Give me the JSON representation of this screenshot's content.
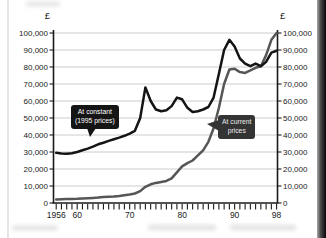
{
  "chart_data": {
    "type": "line",
    "title": "",
    "currency": "£",
    "xlabel": "",
    "ylabel": "£",
    "xlim": [
      1956,
      1998
    ],
    "ylim": [
      0,
      100000
    ],
    "y_tick_interval": 10000,
    "y_axis_sides": [
      "left",
      "right"
    ],
    "grid": "horizontal",
    "x_tick_every_year": true,
    "x_labels": [
      {
        "year": 1956,
        "label": "1956"
      },
      {
        "year": 1960,
        "label": "60"
      },
      {
        "year": 1970,
        "label": "70"
      },
      {
        "year": 1980,
        "label": "80"
      },
      {
        "year": 1990,
        "label": "90"
      },
      {
        "year": 1998,
        "label": "98"
      }
    ],
    "years": [
      1956,
      1957,
      1958,
      1959,
      1960,
      1961,
      1962,
      1963,
      1964,
      1965,
      1966,
      1967,
      1968,
      1969,
      1970,
      1971,
      1972,
      1973,
      1974,
      1975,
      1976,
      1977,
      1978,
      1979,
      1980,
      1981,
      1982,
      1983,
      1984,
      1985,
      1986,
      1987,
      1988,
      1989,
      1990,
      1991,
      1992,
      1993,
      1994,
      1995,
      1996,
      1997,
      1998
    ],
    "series": [
      {
        "name": "At current prices",
        "color": "#565656",
        "width": 2.5,
        "values": [
          2100,
          2200,
          2300,
          2400,
          2500,
          2700,
          2800,
          3000,
          3200,
          3500,
          3700,
          3900,
          4200,
          4600,
          5000,
          5600,
          7000,
          9500,
          11000,
          11800,
          12400,
          13000,
          14500,
          18000,
          21500,
          23500,
          25000,
          28000,
          31000,
          36000,
          44000,
          56000,
          70000,
          78500,
          79000,
          77000,
          76500,
          78000,
          79500,
          80500,
          87000,
          96000,
          100000
        ]
      },
      {
        "name": "At constant (1995 prices)",
        "color": "#141414",
        "width": 2.5,
        "values": [
          29500,
          29200,
          29000,
          29300,
          30000,
          31000,
          32000,
          33200,
          34500,
          35500,
          36500,
          37500,
          38500,
          39500,
          40800,
          42500,
          50000,
          68000,
          60000,
          55000,
          54000,
          54500,
          57000,
          62000,
          61000,
          56000,
          53500,
          54000,
          55000,
          56500,
          62000,
          76000,
          90000,
          96000,
          92000,
          85000,
          82000,
          80500,
          82000,
          80500,
          83000,
          88500,
          89500
        ]
      }
    ],
    "annotations": [
      {
        "id": "constant",
        "lines": [
          "At constant",
          "(1995 prices)"
        ],
        "points_to": "constant-prices-line"
      },
      {
        "id": "current",
        "lines": [
          "At current",
          "prices"
        ],
        "points_to": "current-prices-line"
      }
    ]
  },
  "colors": {
    "grid": "#c6c6c6",
    "axis": "#1a1a1a",
    "tick_label": "#1a1a1a"
  }
}
